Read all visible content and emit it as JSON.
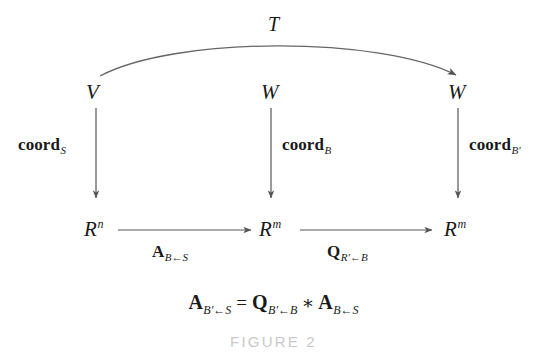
{
  "figure": {
    "caption": "FIGURE 2",
    "background_color": "#ffffff",
    "ink_color": "#1a1a1a",
    "arrow_color": "#555555",
    "caption_color": "#c9c9c9"
  },
  "nodes": {
    "top": [
      {
        "id": "V",
        "base": "V",
        "sup": ""
      },
      {
        "id": "W1",
        "base": "W",
        "sup": ""
      },
      {
        "id": "W2",
        "base": "W",
        "sup": ""
      }
    ],
    "bottom": [
      {
        "id": "Rn",
        "base": "R",
        "sup": "n"
      },
      {
        "id": "Rm1",
        "base": "R",
        "sup": "m"
      },
      {
        "id": "Rm2",
        "base": "R",
        "sup": "m"
      }
    ]
  },
  "arrows": {
    "curved_top": {
      "label_base": "T",
      "from": "V",
      "to": "W2"
    },
    "vertical": [
      {
        "label_base": "coord",
        "label_sub": "S",
        "from": "V",
        "to": "Rn"
      },
      {
        "label_base": "coord",
        "label_sub": "B",
        "from": "W1",
        "to": "Rm1"
      },
      {
        "label_base": "coord",
        "label_sub": "B′",
        "from": "W2",
        "to": "Rm2"
      }
    ],
    "horizontal": [
      {
        "label_big": "A",
        "sub_left": "B",
        "sub_arrow": "←",
        "sub_right": "S",
        "from": "Rn",
        "to": "Rm1"
      },
      {
        "label_big": "Q",
        "sub_left": "R′",
        "sub_arrow": "←",
        "sub_right": "B",
        "from": "Rm1",
        "to": "Rm2"
      }
    ]
  },
  "equation": {
    "lhs": {
      "big": "A",
      "sub_left": "B′",
      "sub_arrow": "←",
      "sub_right": "S"
    },
    "equals": "=",
    "rhs1": {
      "big": "Q",
      "sub_left": "B′",
      "sub_arrow": "←",
      "sub_right": "B"
    },
    "operator": "∗",
    "rhs2": {
      "big": "A",
      "sub_left": "B",
      "sub_arrow": "←",
      "sub_right": "S"
    }
  }
}
